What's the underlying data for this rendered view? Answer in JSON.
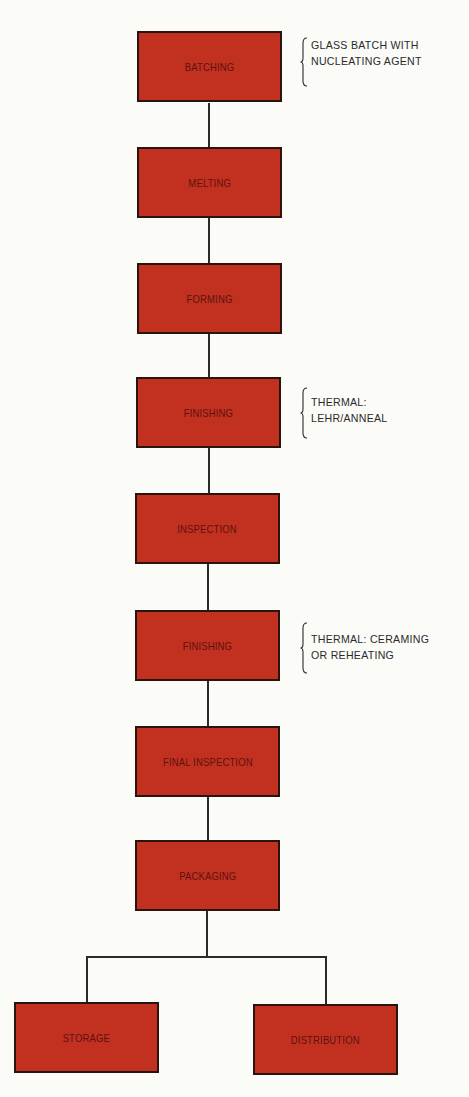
{
  "diagram": {
    "type": "flowchart",
    "colors": {
      "box_fill": "#c2311f",
      "box_border": "#2a1410",
      "box_text": "#5c1212",
      "connector": "#2a2a2a",
      "note_text": "#2a2a2a"
    },
    "steps": [
      {
        "label": "BATCHING"
      },
      {
        "label": "MELTING"
      },
      {
        "label": "FORMING"
      },
      {
        "label": "FINISHING"
      },
      {
        "label": "INSPECTION"
      },
      {
        "label": "FINISHING"
      },
      {
        "label": "FINAL INSPECTION"
      },
      {
        "label": "PACKAGING"
      }
    ],
    "branches": [
      {
        "label": "STORAGE"
      },
      {
        "label": "DISTRIBUTION"
      }
    ],
    "notes": [
      {
        "attached_to": "BATCHING",
        "line1": "GLASS BATCH WITH",
        "line2": "NUCLEATING AGENT"
      },
      {
        "attached_to": "FINISHING (1)",
        "line1": "THERMAL:",
        "line2": "LEHR/ANNEAL"
      },
      {
        "attached_to": "FINISHING (2)",
        "line1": "THERMAL: CERAMING",
        "line2": "OR REHEATING"
      }
    ]
  }
}
